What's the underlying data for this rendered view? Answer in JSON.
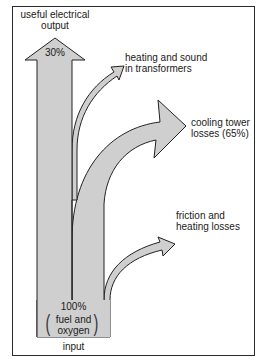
{
  "diagram": {
    "type": "sankey-energy-flow",
    "colors": {
      "arrow_fill": "#cfcfcf",
      "arrow_stroke": "#222222",
      "frame": "#2a2a2a",
      "background": "#ffffff"
    },
    "input": {
      "percent": "100%",
      "line1": "fuel and",
      "line2": "oxygen",
      "label": "input"
    },
    "output": {
      "line1": "useful electrical",
      "line2": "output",
      "percent": "30%"
    },
    "losses": [
      {
        "id": "transformers",
        "line1": "heating and sound",
        "line2": "in transformers"
      },
      {
        "id": "cooling",
        "line1": "cooling tower",
        "line2": "losses (65%)"
      },
      {
        "id": "friction",
        "line1": "friction and",
        "line2": "heating losses"
      }
    ]
  }
}
